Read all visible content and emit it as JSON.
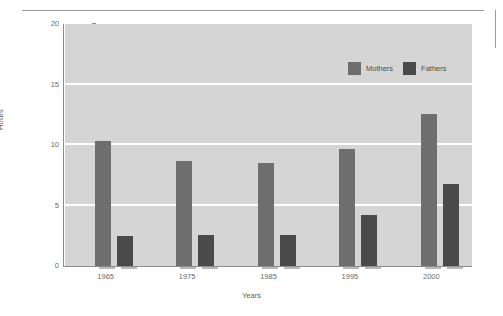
{
  "chart_data": {
    "type": "bar",
    "title": "",
    "xlabel": "Years",
    "ylabel": "Hours",
    "categories": [
      "1965",
      "1975",
      "1985",
      "1995",
      "2000"
    ],
    "series": [
      {
        "name": "Mothers",
        "color": "#6e6e6e",
        "values": [
          10.3,
          8.7,
          8.5,
          9.7,
          12.6
        ]
      },
      {
        "name": "Fathers",
        "color": "#4a4a4a",
        "values": [
          2.5,
          2.6,
          2.6,
          4.2,
          6.8
        ]
      }
    ],
    "ylim": [
      0,
      20
    ],
    "yticks": [
      "0",
      "5",
      "10",
      "15",
      "20"
    ],
    "ytick_values": [
      0,
      5,
      10,
      15,
      20
    ],
    "grid": true,
    "gridline_values": [
      5,
      10,
      15
    ],
    "legend_position": "top-right",
    "plot_background": "#d5d5d5",
    "gridline_color": "#ffffff",
    "axis_color": "#8d8d8d",
    "shadow_color": "#b8b8b8"
  }
}
